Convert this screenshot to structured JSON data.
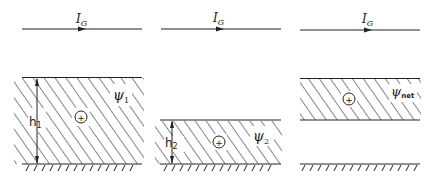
{
  "diagram": {
    "panels": [
      {
        "id": "panel-1",
        "current_label": "I",
        "current_sub": "G",
        "height_label": "h",
        "height_sub": "1",
        "flux_label": "ψ",
        "flux_sub": "1",
        "charge_symbol": "+"
      },
      {
        "id": "panel-2",
        "current_label": "I",
        "current_sub": "G",
        "height_label": "h",
        "height_sub": "2",
        "flux_label": "ψ",
        "flux_sub": "2",
        "charge_symbol": "+"
      },
      {
        "id": "panel-3",
        "current_label": "I",
        "current_sub": "G",
        "flux_label": "ψ",
        "flux_sub": "net",
        "charge_symbol": "+"
      }
    ],
    "colors": {
      "line": "#222222",
      "background": "#ffffff"
    }
  }
}
